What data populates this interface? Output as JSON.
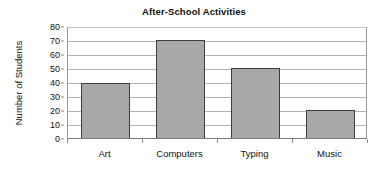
{
  "chart_data": {
    "type": "bar",
    "title": "After-School Activities",
    "xlabel": "",
    "ylabel": "Number of Students",
    "categories": [
      "Art",
      "Computers",
      "Typing",
      "Music"
    ],
    "values": [
      40,
      71,
      51,
      20.5
    ],
    "ylim": [
      0,
      80
    ],
    "ytick_labels": [
      "80",
      "70",
      "60",
      "50",
      "40",
      "30",
      "20",
      "10",
      "0"
    ],
    "ytick_values": [
      80,
      70,
      60,
      50,
      40,
      30,
      20,
      10,
      0
    ],
    "ystep": 10,
    "grid": "horizontal",
    "legend": "none",
    "bar_fill_color": "#a8a8a8",
    "bar_edge_color": "#3d3d3d",
    "gridline_color": "#b2b2b2",
    "axis_color": "#7b7b7b",
    "background_color": "#ffffff",
    "text_color": "#111111"
  }
}
